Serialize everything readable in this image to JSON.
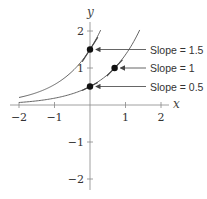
{
  "chart_data": {
    "type": "line",
    "title": "",
    "xlabel": "x",
    "ylabel": "y",
    "xlim": [
      -2,
      2
    ],
    "ylim": [
      -2,
      2
    ],
    "grid": false,
    "x_ticks": [
      -2,
      -1,
      1,
      2
    ],
    "x_tick_labels": [
      "−2",
      "−1",
      "1",
      "2"
    ],
    "y_ticks": [
      2,
      1,
      -1,
      -2
    ],
    "y_tick_labels": [
      "2",
      "1",
      "−1",
      "−2"
    ],
    "series": [
      {
        "name": "y = 1.5e^x",
        "function": "1.5*exp(x)",
        "x_range": [
          -2,
          0.3
        ]
      },
      {
        "name": "y = 0.5e^x",
        "function": "0.5*exp(x)",
        "x_range": [
          -2,
          1.4
        ]
      }
    ],
    "points": [
      {
        "x": 0,
        "y": 1.5,
        "slope": 1.5,
        "label": "Slope = 1.5"
      },
      {
        "x": 0.693,
        "y": 1,
        "slope": 1,
        "label": "Slope = 1"
      },
      {
        "x": 0,
        "y": 0.5,
        "slope": 0.5,
        "label": "Slope = 0.5"
      }
    ],
    "color": "#555555"
  }
}
